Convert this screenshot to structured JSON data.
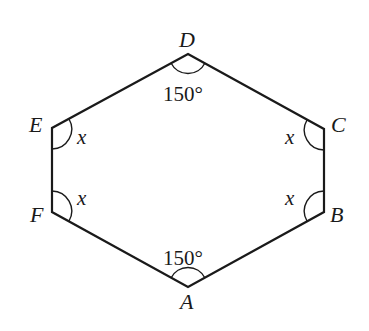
{
  "diagram": {
    "type": "hexagon",
    "vertices": {
      "A": {
        "label": "A",
        "x": 188,
        "y": 287
      },
      "B": {
        "label": "B",
        "x": 324,
        "y": 212
      },
      "C": {
        "label": "C",
        "x": 324,
        "y": 129
      },
      "D": {
        "label": "D",
        "x": 188,
        "y": 54
      },
      "E": {
        "label": "E",
        "x": 52,
        "y": 128
      },
      "F": {
        "label": "F",
        "x": 52,
        "y": 212
      }
    },
    "angles": {
      "D": "150°",
      "A": "150°",
      "E": "x",
      "F": "x",
      "C": "x",
      "B": "x"
    },
    "stroke_color": "#1a1a1a"
  }
}
